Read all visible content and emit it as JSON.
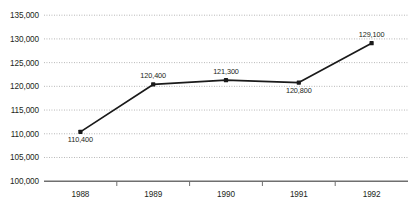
{
  "chart_data": {
    "type": "line",
    "title": "",
    "subtitle": "",
    "xlabel": "",
    "ylabel": "",
    "categories": [
      "1988",
      "1989",
      "1990",
      "1991",
      "1992"
    ],
    "values": [
      110400,
      120400,
      121300,
      120800,
      129100
    ],
    "point_labels": [
      "110,400",
      "120,400",
      "121,300",
      "120,800",
      "129,100"
    ],
    "point_label_positions": [
      "below",
      "above",
      "above",
      "below",
      "above"
    ],
    "ylim": [
      100000,
      135000
    ],
    "ytick_values": [
      100000,
      105000,
      110000,
      115000,
      120000,
      125000,
      130000,
      135000
    ],
    "ytick_labels": [
      "100,000",
      "105,000",
      "110,000",
      "115,000",
      "120,000",
      "125,000",
      "130,000",
      "135,000"
    ],
    "grid": true,
    "legend": false,
    "series": [
      {
        "name": "",
        "values": [
          110400,
          120400,
          121300,
          120800,
          129100
        ]
      }
    ],
    "colors": {
      "line": "#1a1a1a",
      "marker": "#1a1a1a",
      "gridline": "#9b9b9b",
      "axis": "#6f6f6f",
      "text": "#231f20",
      "background": "#ffffff"
    }
  }
}
